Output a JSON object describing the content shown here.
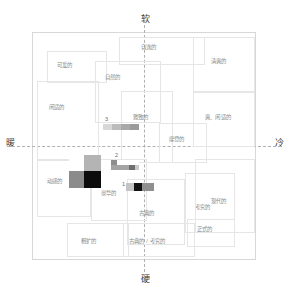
{
  "axes": {
    "top": "软",
    "bottom": "硬",
    "left": "暖",
    "right": "冷"
  },
  "regions": [
    {
      "label": "可爱的",
      "x": 14,
      "y": 18,
      "w": 60,
      "h": 32,
      "lx": 24,
      "ly": 30
    },
    {
      "label": "自然的",
      "x": 62,
      "y": 28,
      "w": 66,
      "h": 62,
      "lx": 72,
      "ly": 42
    },
    {
      "label": "自逸的",
      "x": 86,
      "y": 4,
      "w": 86,
      "h": 28,
      "lx": 108,
      "ly": 12
    },
    {
      "label": "清爽的",
      "x": 160,
      "y": 4,
      "w": 62,
      "h": 56,
      "lx": 178,
      "ly": 26
    },
    {
      "label": "闲适的",
      "x": 4,
      "y": 48,
      "w": 62,
      "h": 80,
      "lx": 16,
      "ly": 72
    },
    {
      "label": "雅致的",
      "x": 88,
      "y": 58,
      "w": 52,
      "h": 72,
      "lx": 100,
      "ly": 82
    },
    {
      "label": "爽、闲适的",
      "x": 160,
      "y": 58,
      "w": 62,
      "h": 56,
      "lx": 172,
      "ly": 82
    },
    {
      "label": "摩登的",
      "x": 126,
      "y": 90,
      "w": 48,
      "h": 40,
      "lx": 136,
      "ly": 104
    },
    {
      "label": "动感的",
      "x": 4,
      "y": 126,
      "w": 54,
      "h": 58,
      "lx": 14,
      "ly": 146
    },
    {
      "label": "豪华的",
      "x": 58,
      "y": 126,
      "w": 56,
      "h": 62,
      "lx": 68,
      "ly": 158
    },
    {
      "label": "古典的",
      "x": 94,
      "y": 146,
      "w": 58,
      "h": 66,
      "lx": 106,
      "ly": 178
    },
    {
      "label": "考究的",
      "x": 152,
      "y": 140,
      "w": 50,
      "h": 60,
      "lx": 162,
      "ly": 172
    },
    {
      "label": "现代的",
      "x": 162,
      "y": 126,
      "w": 60,
      "h": 74,
      "lx": 178,
      "ly": 166
    },
    {
      "label": "正式的",
      "x": 154,
      "y": 186,
      "w": 48,
      "h": 28,
      "lx": 164,
      "ly": 194
    },
    {
      "label": "粗犷的",
      "x": 34,
      "y": 190,
      "w": 62,
      "h": 34,
      "lx": 48,
      "ly": 206
    },
    {
      "label": "古典的 / 考究的",
      "x": 90,
      "y": 190,
      "w": 72,
      "h": 34,
      "lx": 96,
      "ly": 206
    }
  ],
  "swatch_groups": [
    {
      "number": "3",
      "x": 70,
      "y": 91,
      "num_x": 2,
      "num_y": -7,
      "rows": [
        {
          "cells": [
            {
              "color": "#d8d8d8",
              "w": 9,
              "h": 6
            },
            {
              "color": "#bcbcbc",
              "w": 9,
              "h": 6
            },
            {
              "color": "#a8a8a8",
              "w": 9,
              "h": 6
            },
            {
              "color": "#9a9a9a",
              "w": 9,
              "h": 6
            }
          ]
        }
      ]
    },
    {
      "number": "2",
      "x": 78,
      "y": 127,
      "num_x": 4,
      "num_y": -7,
      "rows": [
        {
          "cells": [
            {
              "color": "#8e8e8e",
              "w": 6,
              "h": 5
            },
            {
              "color": "#ffffff",
              "w": 22,
              "h": 5
            }
          ]
        },
        {
          "cells": [
            {
              "color": "#a4a4a4",
              "w": 18,
              "h": 5
            },
            {
              "color": "#6e6e6e",
              "w": 6,
              "h": 5
            },
            {
              "color": "#c9c9c9",
              "w": 4,
              "h": 5
            }
          ]
        }
      ]
    },
    {
      "number": "1",
      "x": 93,
      "y": 150,
      "num_x": -4,
      "num_y": -1,
      "rows": [
        {
          "cells": [
            {
              "color": "#c4c4c4",
              "w": 8,
              "h": 8
            },
            {
              "color": "#111111",
              "w": 8,
              "h": 8
            },
            {
              "color": "#8f8f8f",
              "w": 12,
              "h": 8
            }
          ]
        }
      ]
    },
    {
      "number": "",
      "x": 36,
      "y": 122,
      "num_x": 0,
      "num_y": 0,
      "rows": [
        {
          "cells": [
            {
              "color": "#ffffff",
              "w": 15,
              "h": 16
            },
            {
              "color": "#b4b4b4",
              "w": 17,
              "h": 16
            }
          ]
        },
        {
          "cells": [
            {
              "color": "#8b8b8b",
              "w": 15,
              "h": 17
            },
            {
              "color": "#0c0c0c",
              "w": 17,
              "h": 17
            }
          ]
        }
      ]
    }
  ],
  "chart_data": {
    "type": "scatter",
    "title": "",
    "xlabel": "暖 — 冷",
    "ylabel": "软 — 硬",
    "xlim": [
      -1,
      1
    ],
    "ylim": [
      -1,
      1
    ],
    "grid": true,
    "legend": "none",
    "axis_poles": {
      "top": "软",
      "bottom": "硬",
      "left": "暖",
      "right": "冷"
    },
    "annotations": [
      "1",
      "2",
      "3"
    ],
    "categories": [
      "可爱的",
      "自然的",
      "自逸的",
      "清爽的",
      "闲适的",
      "雅致的",
      "爽、闲适的",
      "摩登的",
      "动感的",
      "豪华的",
      "古典的",
      "考究的",
      "现代的",
      "正式的",
      "粗犷的",
      "古典的 / 考究的"
    ],
    "series": [
      {
        "name": "3",
        "x": 0.05,
        "y": 0.28,
        "colors": [
          "#d8d8d8",
          "#bcbcbc",
          "#a8a8a8",
          "#9a9a9a"
        ]
      },
      {
        "name": "2",
        "x": 0.1,
        "y": -0.06,
        "colors": [
          "#8e8e8e",
          "#a4a4a4",
          "#6e6e6e",
          "#c9c9c9"
        ]
      },
      {
        "name": "1",
        "x": 0.24,
        "y": -0.27,
        "colors": [
          "#c4c4c4",
          "#111111",
          "#8f8f8f"
        ]
      },
      {
        "name": "",
        "x": -0.45,
        "y": -0.16,
        "colors": [
          "#ffffff",
          "#b4b4b4",
          "#8b8b8b",
          "#0c0c0c"
        ]
      }
    ]
  }
}
